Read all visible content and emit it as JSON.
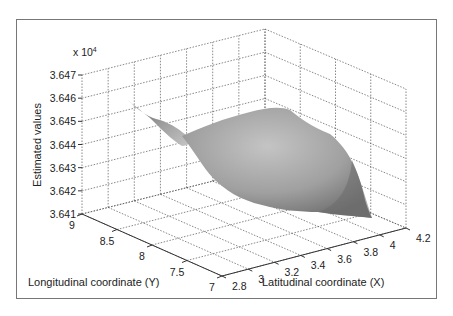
{
  "chart_data": {
    "type": "surface3d",
    "title": "",
    "xlabel": "Latitudinal coordinate (X)",
    "ylabel": "Longitudinal coordinate (Y)",
    "zlabel": "Estimated values",
    "z_multiplier": "x 10^4",
    "xlim": [
      2.8,
      4.2
    ],
    "ylim": [
      7,
      9
    ],
    "zlim": [
      3.641,
      3.647
    ],
    "x_ticks": [
      "2.8",
      "3",
      "3.2",
      "3.4",
      "3.6",
      "3.8",
      "4",
      "4.2"
    ],
    "y_ticks": [
      "7",
      "7.5",
      "8",
      "8.5",
      "9"
    ],
    "z_ticks": [
      "3.641",
      "3.642",
      "3.643",
      "3.644",
      "3.645",
      "3.646",
      "3.647"
    ],
    "grid": true,
    "colormap": "gray",
    "surface_description": "Gray shaded surface; sharp spike near (X≈2.8, Y≈9) at ~3.6458e4, broad dome around X 3.2–3.8 at ~3.6445e4, dropping to ~3.6415e4 near (X≈4, Y≈7.5)",
    "surface_points": [
      {
        "x": 2.8,
        "y": 9.0,
        "z": 3.6458
      },
      {
        "x": 3.0,
        "y": 8.6,
        "z": 3.6447
      },
      {
        "x": 3.2,
        "y": 8.2,
        "z": 3.6442
      },
      {
        "x": 3.4,
        "y": 8.6,
        "z": 3.6446
      },
      {
        "x": 3.6,
        "y": 8.8,
        "z": 3.6447
      },
      {
        "x": 3.8,
        "y": 8.8,
        "z": 3.6446
      },
      {
        "x": 4.0,
        "y": 8.4,
        "z": 3.644
      },
      {
        "x": 4.0,
        "y": 7.6,
        "z": 3.6415
      },
      {
        "x": 3.6,
        "y": 7.8,
        "z": 3.642
      },
      {
        "x": 3.4,
        "y": 8.0,
        "z": 3.6428
      }
    ]
  },
  "labels": {
    "multiplier_prefix": "x 10",
    "multiplier_exp": "4",
    "zlabel": "Estimated values",
    "ylabel": "Longitudinal coordinate (Y)",
    "xlabel": "Latitudinal coordinate (X)"
  }
}
